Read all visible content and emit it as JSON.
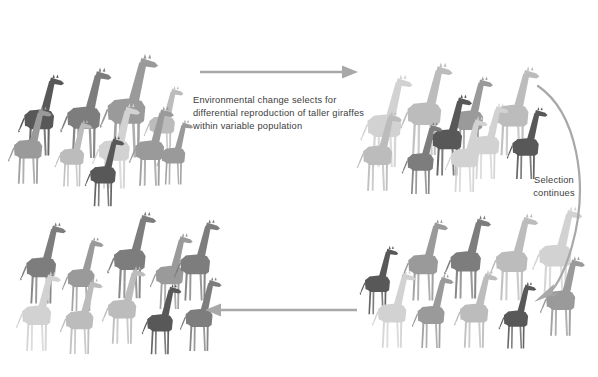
{
  "diagram": {
    "background_color": "#ffffff",
    "width": 598,
    "height": 377
  },
  "captions": {
    "main": "Environmental change selects for differential reproduction of taller giraffes within variable population",
    "selection": "Selection continues"
  },
  "arrows": {
    "top": {
      "name": "arrow-right-top",
      "direction": "right",
      "color": "#a8a8a8"
    },
    "bottom": {
      "name": "arrow-left-bottom",
      "direction": "left",
      "color": "#a8a8a8"
    },
    "curved": {
      "name": "arrow-curved-right",
      "direction": "down-left",
      "color": "#a8a8a8"
    }
  },
  "colors": {
    "dark": "#585858",
    "mid_dark": "#7d7d7d",
    "mid": "#9a9a9a",
    "light": "#bcbcbc",
    "lighter": "#d2d2d2",
    "lightest": "#e4e4e4",
    "text": "#3c3c3c",
    "arrow": "#a8a8a8"
  },
  "panels": [
    {
      "name": "panel-original-population",
      "label": "Original variable population",
      "x": 8,
      "y": 22,
      "width": 190,
      "height": 168,
      "giraffes": [
        {
          "x": 16,
          "y": 160,
          "h": 88,
          "color": "#585858"
        },
        {
          "x": 58,
          "y": 163,
          "h": 98,
          "color": "#7d7d7d"
        },
        {
          "x": 97,
          "y": 163,
          "h": 112,
          "color": "#9a9a9a"
        },
        {
          "x": 142,
          "y": 160,
          "h": 76,
          "color": "#bcbcbc"
        },
        {
          "x": 6,
          "y": 188,
          "h": 84,
          "color": "#9a9a9a"
        },
        {
          "x": 53,
          "y": 190,
          "h": 72,
          "color": "#bcbcbc"
        },
        {
          "x": 90,
          "y": 193,
          "h": 92,
          "color": "#d2d2d2"
        },
        {
          "x": 127,
          "y": 190,
          "h": 86,
          "color": "#9a9a9a"
        },
        {
          "x": 83,
          "y": 210,
          "h": 76,
          "color": "#585858"
        },
        {
          "x": 155,
          "y": 188,
          "h": 70,
          "color": "#9a9a9a"
        }
      ]
    },
    {
      "name": "panel-after-selection",
      "label": "Population after selection",
      "x": 356,
      "y": 22,
      "width": 190,
      "height": 168,
      "giraffes": [
        {
          "x": 358,
          "y": 172,
          "h": 100,
          "color": "#d2d2d2"
        },
        {
          "x": 398,
          "y": 160,
          "h": 100,
          "color": "#bcbcbc"
        },
        {
          "x": 446,
          "y": 160,
          "h": 86,
          "color": "#9a9a9a"
        },
        {
          "x": 487,
          "y": 160,
          "h": 96,
          "color": "#bcbcbc"
        },
        {
          "x": 424,
          "y": 180,
          "h": 88,
          "color": "#585858"
        },
        {
          "x": 464,
          "y": 183,
          "h": 82,
          "color": "#d2d2d2"
        },
        {
          "x": 355,
          "y": 195,
          "h": 86,
          "color": "#bcbcbc"
        },
        {
          "x": 400,
          "y": 198,
          "h": 78,
          "color": "#7d7d7d"
        },
        {
          "x": 443,
          "y": 196,
          "h": 82,
          "color": "#d2d2d2"
        },
        {
          "x": 505,
          "y": 183,
          "h": 78,
          "color": "#585858"
        }
      ]
    },
    {
      "name": "panel-further-selection",
      "label": "Population with further selection",
      "x": 356,
      "y": 220,
      "width": 200,
      "height": 148,
      "giraffes": [
        {
          "x": 358,
          "y": 318,
          "h": 74,
          "color": "#585858"
        },
        {
          "x": 400,
          "y": 305,
          "h": 88,
          "color": "#9a9a9a"
        },
        {
          "x": 442,
          "y": 303,
          "h": 90,
          "color": "#7d7d7d"
        },
        {
          "x": 487,
          "y": 305,
          "h": 94,
          "color": "#bcbcbc"
        },
        {
          "x": 530,
          "y": 300,
          "h": 96,
          "color": "#d2d2d2"
        },
        {
          "x": 370,
          "y": 352,
          "h": 84,
          "color": "#d2d2d2"
        },
        {
          "x": 410,
          "y": 352,
          "h": 80,
          "color": "#9a9a9a"
        },
        {
          "x": 452,
          "y": 352,
          "h": 84,
          "color": "#bcbcbc"
        },
        {
          "x": 497,
          "y": 352,
          "h": 72,
          "color": "#585858"
        },
        {
          "x": 538,
          "y": 340,
          "h": 86,
          "color": "#9a9a9a"
        }
      ]
    },
    {
      "name": "panel-final-tall-population",
      "label": "Final tall population",
      "x": 12,
      "y": 218,
      "width": 190,
      "height": 150,
      "giraffes": [
        {
          "x": 18,
          "y": 308,
          "h": 88,
          "color": "#7d7d7d"
        },
        {
          "x": 60,
          "y": 315,
          "h": 80,
          "color": "#9a9a9a"
        },
        {
          "x": 105,
          "y": 303,
          "h": 94,
          "color": "#7d7d7d"
        },
        {
          "x": 148,
          "y": 313,
          "h": 82,
          "color": "#9a9a9a"
        },
        {
          "x": 172,
          "y": 305,
          "h": 88,
          "color": "#7d7d7d"
        },
        {
          "x": 14,
          "y": 355,
          "h": 86,
          "color": "#d2d2d2"
        },
        {
          "x": 58,
          "y": 358,
          "h": 82,
          "color": "#bcbcbc"
        },
        {
          "x": 100,
          "y": 348,
          "h": 84,
          "color": "#bcbcbc"
        },
        {
          "x": 140,
          "y": 358,
          "h": 76,
          "color": "#585858"
        },
        {
          "x": 178,
          "y": 355,
          "h": 80,
          "color": "#7d7d7d"
        }
      ]
    }
  ]
}
